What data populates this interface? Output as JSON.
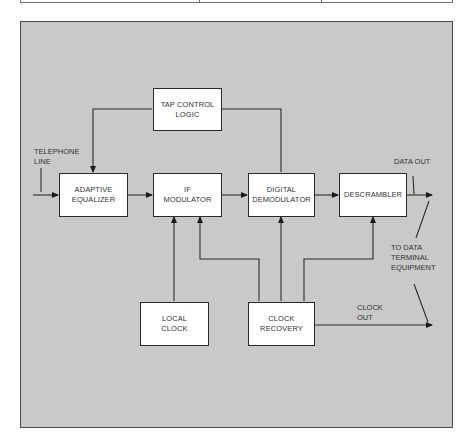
{
  "diagram": {
    "colors": {
      "panel": "#c9c9c9",
      "box_fill": "#ffffff",
      "line": "#2a2a2a"
    },
    "blocks": {
      "tap_control": {
        "line1": "TAP CONTROL",
        "line2": "LOGIC"
      },
      "adaptive_equalizer": {
        "line1": "ADAPTIVE",
        "line2": "EQUALIZER"
      },
      "if_modulator": {
        "line1": "IF",
        "line2": "MODULATOR"
      },
      "digital_demodulator": {
        "line1": "DIGITAL",
        "line2": "DEMODULATOR"
      },
      "descrambler": {
        "line1": "DESCRAMBLER"
      },
      "local_clock": {
        "line1": "LOCAL",
        "line2": "CLOCK"
      },
      "clock_recovery": {
        "line1": "CLOCK",
        "line2": "RECOVERY"
      }
    },
    "labels": {
      "telephone_line": {
        "line1": "TELEPHONE",
        "line2": "LINE"
      },
      "data_out": "DATA OUT",
      "to_dte": {
        "line1": "TO DATA",
        "line2": "TERMINAL",
        "line3": "EQUIPMENT"
      },
      "clock_out": {
        "line1": "CLOCK",
        "line2": "OUT"
      }
    },
    "connections": [
      "TELEPHONE LINE -> ADAPTIVE EQUALIZER",
      "ADAPTIVE EQUALIZER -> IF MODULATOR",
      "IF MODULATOR -> DIGITAL DEMODULATOR",
      "DIGITAL DEMODULATOR -> DESCRAMBLER",
      "DESCRAMBLER -> DATA OUT",
      "DIGITAL DEMODULATOR -> TAP CONTROL LOGIC",
      "TAP CONTROL LOGIC -> ADAPTIVE EQUALIZER",
      "LOCAL CLOCK -> IF MODULATOR",
      "CLOCK RECOVERY -> IF MODULATOR",
      "CLOCK RECOVERY -> DIGITAL DEMODULATOR",
      "CLOCK RECOVERY -> DESCRAMBLER",
      "CLOCK RECOVERY -> CLOCK OUT"
    ]
  }
}
